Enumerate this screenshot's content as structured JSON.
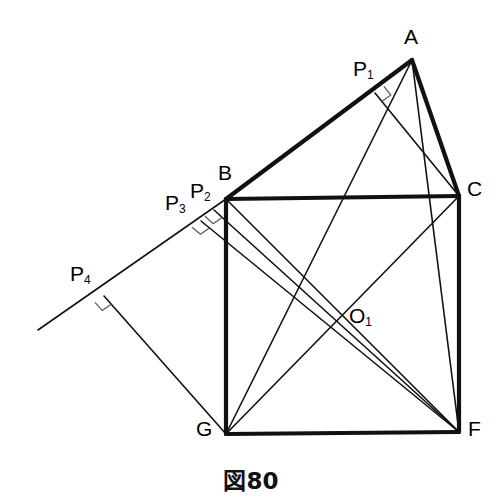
{
  "figure": {
    "caption": "図80",
    "background_color": "#ffffff",
    "stroke_color": "#111111",
    "thick_stroke_width": 4.2,
    "thin_stroke_width": 1.6,
    "hair_stroke_width": 1.3
  },
  "labels": {
    "A": "A",
    "B": "B",
    "C": "C",
    "F": "F",
    "G": "G",
    "O1_main": "O",
    "O1_sub": "1",
    "P1_main": "P",
    "P1_sub": "1",
    "P2_main": "P",
    "P2_sub": "2",
    "P3_main": "P",
    "P3_sub": "3",
    "P4_main": "P",
    "P4_sub": "4"
  },
  "points": {
    "A": {
      "x": 412,
      "y": 60
    },
    "B": {
      "x": 226,
      "y": 199
    },
    "C": {
      "x": 459,
      "y": 196
    },
    "F": {
      "x": 459,
      "y": 432
    },
    "G": {
      "x": 226,
      "y": 434
    },
    "O1": {
      "x": 340,
      "y": 313
    },
    "P1": {
      "x": 375,
      "y": 93
    },
    "P2": {
      "x": 214,
      "y": 210
    },
    "P3": {
      "x": 201,
      "y": 221
    },
    "P4": {
      "x": 104,
      "y": 296
    },
    "RayStart": {
      "x": 38,
      "y": 330
    }
  },
  "label_positions": {
    "A": {
      "x": 404,
      "y": 26
    },
    "B": {
      "x": 218,
      "y": 162
    },
    "C": {
      "x": 467,
      "y": 178
    },
    "F": {
      "x": 468,
      "y": 418
    },
    "G": {
      "x": 196,
      "y": 418
    },
    "O1": {
      "x": 349,
      "y": 305
    },
    "P1": {
      "x": 353,
      "y": 58
    },
    "P2": {
      "x": 190,
      "y": 180
    },
    "P3": {
      "x": 165,
      "y": 192
    },
    "P4": {
      "x": 70,
      "y": 263
    }
  },
  "edges": {
    "thick": [
      {
        "name": "AB",
        "from": "A",
        "to": "B"
      },
      {
        "name": "AC",
        "from": "A",
        "to": "C"
      },
      {
        "name": "BC",
        "from": "B",
        "to": "C"
      },
      {
        "name": "BG",
        "from": "B",
        "to": "G"
      },
      {
        "name": "CF",
        "from": "C",
        "to": "F"
      },
      {
        "name": "GF",
        "from": "G",
        "to": "F"
      }
    ],
    "thin": [
      {
        "name": "AG",
        "from": "A",
        "to": "G"
      },
      {
        "name": "AF",
        "from": "A",
        "to": "F"
      },
      {
        "name": "GC",
        "from": "G",
        "to": "C"
      },
      {
        "name": "BF",
        "from": "B",
        "to": "F"
      },
      {
        "name": "P1C",
        "from": "P1",
        "to": "C"
      },
      {
        "name": "P2F",
        "from": "P2",
        "to": "F"
      },
      {
        "name": "P3F",
        "from": "P3",
        "to": "F"
      },
      {
        "name": "P4G",
        "from": "P4",
        "to": "G"
      },
      {
        "name": "ray-BP4",
        "from": "B",
        "to": "RayStart"
      }
    ]
  },
  "right_angle_marks": [
    {
      "name": "right-angle-at-p1",
      "x": 375,
      "y": 93
    },
    {
      "name": "right-angle-at-p2",
      "x": 214,
      "y": 210
    },
    {
      "name": "right-angle-at-p3",
      "x": 201,
      "y": 221
    },
    {
      "name": "right-angle-at-p4",
      "x": 104,
      "y": 296
    }
  ]
}
